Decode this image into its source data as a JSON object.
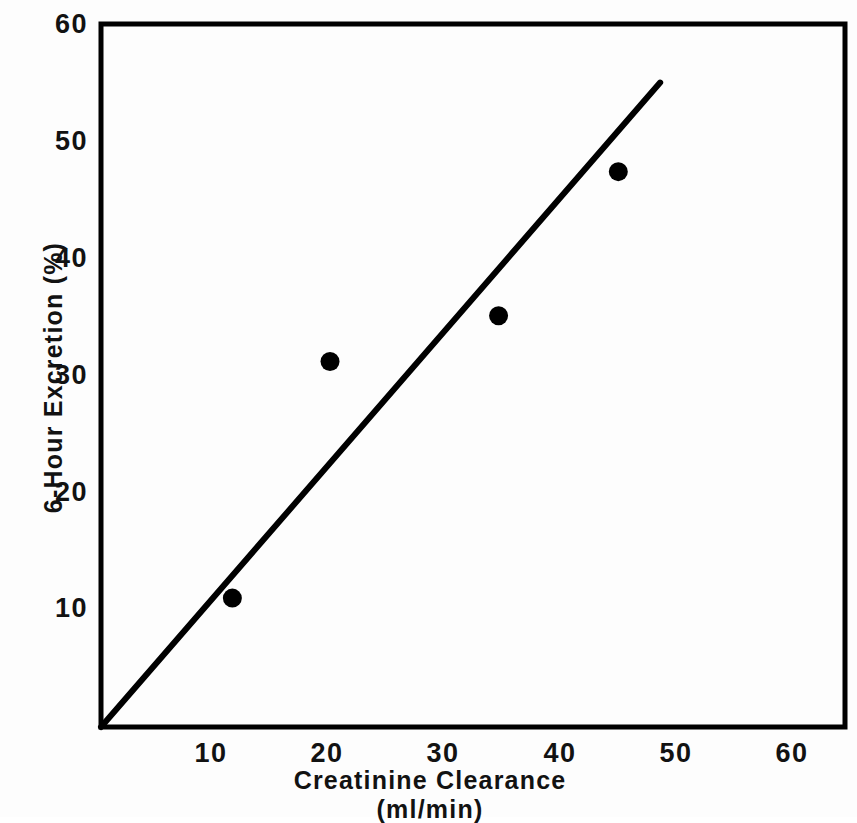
{
  "chart_data": {
    "type": "scatter",
    "title": "",
    "xlabel": "Creatinine Clearance",
    "xlabel_units": "(ml/min)",
    "ylabel": "6-Hour Excretion (%)",
    "xlim": [
      0,
      64
    ],
    "ylim": [
      0,
      60
    ],
    "xticks": [
      10,
      20,
      30,
      40,
      50,
      60
    ],
    "yticks": [
      10,
      20,
      30,
      40,
      50,
      60
    ],
    "xtick_labels": [
      "10",
      "20",
      "30",
      "40",
      "50",
      "60"
    ],
    "ytick_labels": [
      "10",
      "20",
      "30",
      "40",
      "50",
      "60"
    ],
    "grid": false,
    "legend": "none",
    "marker": "filled-circle",
    "marker_color": "#000000",
    "line_color": "#000000",
    "axis_color": "#000000",
    "background_color": "#ffffff",
    "points": [
      {
        "x": 11.3,
        "y": 11.0
      },
      {
        "x": 19.7,
        "y": 31.2
      },
      {
        "x": 34.2,
        "y": 35.1
      },
      {
        "x": 44.5,
        "y": 47.4
      }
    ],
    "series": [
      {
        "name": "observations",
        "x": [
          11.3,
          19.7,
          34.2,
          44.5
        ],
        "values": [
          11.0,
          31.2,
          35.1,
          47.4
        ]
      }
    ],
    "trend_line": {
      "name": "regression-line",
      "x_start": 0.0,
      "y_start": 0.0,
      "x_end": 48.1,
      "y_end": 55.0
    }
  },
  "axis": {
    "y_title": "6-Hour Excretion (%)",
    "x_title_main": "Creatinine Clearance",
    "x_title_units": "(ml/min)"
  }
}
